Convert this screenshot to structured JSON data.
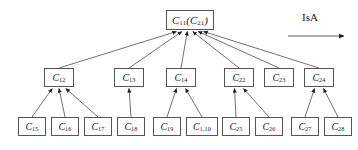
{
  "diagram": {
    "title_text": "",
    "legend": {
      "label": "IsA",
      "arrow_icon": "right-arrow-icon"
    },
    "colors": {
      "box_border": "#555555",
      "box_fill": "#ffffff",
      "edge": "#333333",
      "text": "#1a1a1a",
      "background": "#ffffff"
    },
    "levels": [
      {
        "level": 1,
        "nodes": [
          {
            "id": "root",
            "base": "C",
            "sub": "11",
            "paren_base": "C",
            "paren_sub": "21",
            "label": "C11(C21)",
            "x": 166,
            "y": 10,
            "w": 48,
            "h": 20
          }
        ]
      },
      {
        "level": 2,
        "nodes": [
          {
            "id": "c12",
            "base": "C",
            "sub": "12",
            "label": "C12",
            "x": 44,
            "y": 68,
            "w": 30,
            "h": 19
          },
          {
            "id": "c13",
            "base": "C",
            "sub": "13",
            "label": "C13",
            "x": 114,
            "y": 68,
            "w": 30,
            "h": 19
          },
          {
            "id": "c14",
            "base": "C",
            "sub": "14",
            "label": "C14",
            "x": 166,
            "y": 68,
            "w": 30,
            "h": 19
          },
          {
            "id": "c22",
            "base": "C",
            "sub": "22",
            "label": "C22",
            "x": 224,
            "y": 68,
            "w": 30,
            "h": 19
          },
          {
            "id": "c23",
            "base": "C",
            "sub": "23",
            "label": "C23",
            "x": 264,
            "y": 68,
            "w": 30,
            "h": 19
          },
          {
            "id": "c24",
            "base": "C",
            "sub": "24",
            "label": "C24",
            "x": 304,
            "y": 68,
            "w": 30,
            "h": 19
          }
        ]
      },
      {
        "level": 3,
        "nodes": [
          {
            "id": "c15",
            "base": "C",
            "sub": "15",
            "label": "C15",
            "x": 18,
            "y": 117,
            "w": 28,
            "h": 19
          },
          {
            "id": "c16",
            "base": "C",
            "sub": "16",
            "label": "C16",
            "x": 51,
            "y": 117,
            "w": 28,
            "h": 19
          },
          {
            "id": "c17",
            "base": "C",
            "sub": "17",
            "label": "C17",
            "x": 84,
            "y": 117,
            "w": 28,
            "h": 19
          },
          {
            "id": "c18",
            "base": "C",
            "sub": "18",
            "label": "C18",
            "x": 117,
            "y": 117,
            "w": 28,
            "h": 19
          },
          {
            "id": "c19",
            "base": "C",
            "sub": "19",
            "label": "C19",
            "x": 153,
            "y": 117,
            "w": 28,
            "h": 19
          },
          {
            "id": "c110",
            "base": "C",
            "sub": "1,10",
            "label": "C1,10",
            "x": 186,
            "y": 117,
            "w": 32,
            "h": 19
          },
          {
            "id": "c25",
            "base": "C",
            "sub": "25",
            "label": "C25",
            "x": 222,
            "y": 117,
            "w": 28,
            "h": 19
          },
          {
            "id": "c26",
            "base": "C",
            "sub": "26",
            "label": "C26",
            "x": 255,
            "y": 117,
            "w": 28,
            "h": 19
          },
          {
            "id": "c27",
            "base": "C",
            "sub": "27",
            "label": "C27",
            "x": 291,
            "y": 117,
            "w": 28,
            "h": 19
          },
          {
            "id": "c28",
            "base": "C",
            "sub": "28",
            "label": "C28",
            "x": 324,
            "y": 117,
            "w": 28,
            "h": 19
          }
        ]
      }
    ],
    "edges": [
      {
        "from": "c12",
        "to": "root",
        "relation": "IsA"
      },
      {
        "from": "c13",
        "to": "root",
        "relation": "IsA"
      },
      {
        "from": "c14",
        "to": "root",
        "relation": "IsA"
      },
      {
        "from": "c22",
        "to": "root",
        "relation": "IsA"
      },
      {
        "from": "c23",
        "to": "root",
        "relation": "IsA"
      },
      {
        "from": "c24",
        "to": "root",
        "relation": "IsA"
      },
      {
        "from": "c15",
        "to": "c12",
        "relation": "IsA"
      },
      {
        "from": "c16",
        "to": "c12",
        "relation": "IsA"
      },
      {
        "from": "c17",
        "to": "c12",
        "relation": "IsA"
      },
      {
        "from": "c18",
        "to": "c13",
        "relation": "IsA"
      },
      {
        "from": "c19",
        "to": "c14",
        "relation": "IsA"
      },
      {
        "from": "c110",
        "to": "c14",
        "relation": "IsA"
      },
      {
        "from": "c25",
        "to": "c22",
        "relation": "IsA"
      },
      {
        "from": "c26",
        "to": "c22",
        "relation": "IsA"
      },
      {
        "from": "c27",
        "to": "c24",
        "relation": "IsA"
      },
      {
        "from": "c28",
        "to": "c24",
        "relation": "IsA"
      }
    ]
  }
}
